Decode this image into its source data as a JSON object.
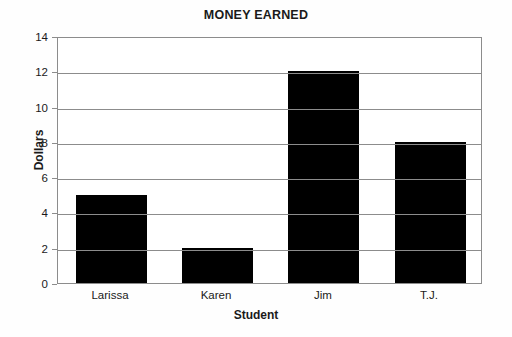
{
  "chart_data": {
    "type": "bar",
    "title": "MONEY EARNED",
    "xlabel": "Student",
    "ylabel": "Dollars",
    "categories": [
      "Larissa",
      "Karen",
      "Jim",
      "T.J."
    ],
    "values": [
      5,
      2,
      12,
      8
    ],
    "ylim": [
      0,
      14
    ],
    "ytick_step": 2,
    "yticks": [
      "0",
      "2",
      "4",
      "6",
      "8",
      "10",
      "12",
      "14"
    ],
    "grid": true,
    "legend": false,
    "bar_color": "#000000",
    "gridline_color": "#8c8c8c",
    "background_color": "#ffffff"
  }
}
